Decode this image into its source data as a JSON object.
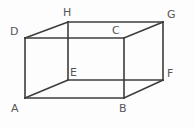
{
  "figure": {
    "kind": "geometry-diagram",
    "shape_name": "cuboid",
    "background_color": "#fdfdfd",
    "edge_color": "#3c3c3c",
    "label_color": "#55565a",
    "edge_width": 1.6,
    "width": 195,
    "height": 128
  },
  "vertices": [
    {
      "id": "A",
      "label": "A",
      "x": 25,
      "y": 98,
      "label_x": 11,
      "label_y": 103,
      "face": "front-bottom-left"
    },
    {
      "id": "B",
      "label": "B",
      "x": 124,
      "y": 98,
      "label_x": 119,
      "label_y": 103,
      "face": "front-bottom-right"
    },
    {
      "id": "C",
      "label": "C",
      "x": 124,
      "y": 38,
      "label_x": 112,
      "label_y": 25,
      "face": "front-top-right"
    },
    {
      "id": "D",
      "label": "D",
      "x": 25,
      "y": 38,
      "label_x": 10,
      "label_y": 26,
      "face": "front-top-left"
    },
    {
      "id": "E",
      "label": "E",
      "x": 68,
      "y": 80,
      "label_x": 70,
      "label_y": 67,
      "face": "back-bottom-left"
    },
    {
      "id": "F",
      "label": "F",
      "x": 163,
      "y": 80,
      "label_x": 167,
      "label_y": 68,
      "face": "back-bottom-right"
    },
    {
      "id": "G",
      "label": "G",
      "x": 163,
      "y": 22,
      "label_x": 167,
      "label_y": 9,
      "face": "back-top-right"
    },
    {
      "id": "H",
      "label": "H",
      "x": 68,
      "y": 22,
      "label_x": 63,
      "label_y": 7,
      "face": "back-top-left"
    }
  ],
  "edges": [
    {
      "id": "AB",
      "from": "A",
      "to": "B",
      "group": "front-face"
    },
    {
      "id": "BC",
      "from": "B",
      "to": "C",
      "group": "front-face"
    },
    {
      "id": "CD",
      "from": "C",
      "to": "D",
      "group": "front-face"
    },
    {
      "id": "DA",
      "from": "D",
      "to": "A",
      "group": "front-face"
    },
    {
      "id": "EF",
      "from": "E",
      "to": "F",
      "group": "back-face"
    },
    {
      "id": "FG",
      "from": "F",
      "to": "G",
      "group": "back-face"
    },
    {
      "id": "GH",
      "from": "G",
      "to": "H",
      "group": "back-face"
    },
    {
      "id": "HE",
      "from": "H",
      "to": "E",
      "group": "back-face"
    },
    {
      "id": "AE",
      "from": "A",
      "to": "E",
      "group": "connector"
    },
    {
      "id": "BF",
      "from": "B",
      "to": "F",
      "group": "connector"
    },
    {
      "id": "CG",
      "from": "C",
      "to": "G",
      "group": "connector"
    },
    {
      "id": "DH",
      "from": "D",
      "to": "H",
      "group": "connector"
    }
  ]
}
